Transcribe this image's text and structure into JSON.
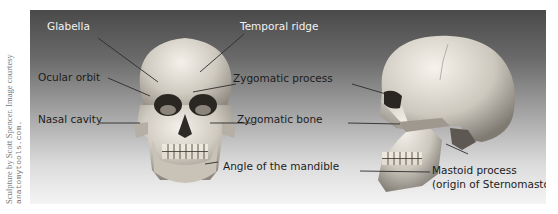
{
  "credit": {
    "line1": "Sculpture by Scott Spencer. Image courtesy",
    "line2": "anatomytools.com."
  },
  "figure": {
    "background_top": "#4a4a4a",
    "background_bottom": "#f4f4f4",
    "views": [
      "front-view-skull",
      "side-view-skull"
    ],
    "labels": {
      "glabella": "Glabella",
      "temporal_ridge": "Temporal ridge",
      "ocular_orbit": "Ocular orbit",
      "zygomatic_process": "Zygomatic process",
      "nasal_cavity": "Nasal cavity",
      "zygomatic_bone": "Zygomatic bone",
      "angle_of_mandible": "Angle of the mandible",
      "mastoid_process": "Mastoid process",
      "mastoid_origin": "(origin of Sternomastoid)"
    }
  }
}
